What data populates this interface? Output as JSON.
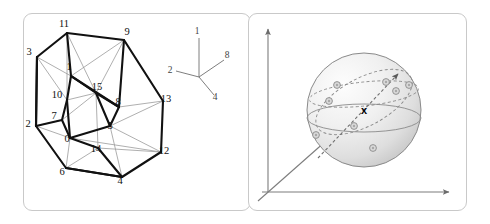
{
  "figure": {
    "background_color": "#ffffff",
    "panel_border_color": "#c9c9c9",
    "panels": [
      {
        "id": "left",
        "name": "tesseract-panel"
      },
      {
        "id": "right",
        "name": "sphere-panel"
      }
    ]
  },
  "left_panel": {
    "name": "tesseract-projection",
    "description": "Projection of a 4-dimensional hypercube (tesseract) showing an outer cube and an inner cube with vertices labelled 0 to 15",
    "edge_color_thick": "#111111",
    "edge_color_thin": "#9a9a9a",
    "vertices": [
      {
        "label": "11",
        "x": 67,
        "y": 33,
        "lx": 64,
        "ly": 27
      },
      {
        "label": "9",
        "x": 124,
        "y": 40,
        "lx": 127,
        "ly": 35
      },
      {
        "label": "3",
        "x": 37,
        "y": 57,
        "lx": 29,
        "ly": 55
      },
      {
        "label": "1",
        "x": 71,
        "y": 76,
        "lx": 69,
        "ly": 70
      },
      {
        "label": "10",
        "x": 67,
        "y": 100,
        "lx": 57,
        "ly": 98
      },
      {
        "label": "15",
        "x": 96,
        "y": 93,
        "lx": 97,
        "ly": 90
      },
      {
        "label": "2",
        "x": 36,
        "y": 126,
        "lx": 28,
        "ly": 127
      },
      {
        "label": "7",
        "x": 62,
        "y": 120,
        "lx": 54,
        "ly": 119
      },
      {
        "label": "8",
        "x": 119,
        "y": 107,
        "lx": 118,
        "ly": 105
      },
      {
        "label": "13",
        "x": 163,
        "y": 101,
        "lx": 166,
        "ly": 102
      },
      {
        "label": "0",
        "x": 70,
        "y": 138,
        "lx": 67,
        "ly": 142
      },
      {
        "label": "5",
        "x": 110,
        "y": 126,
        "lx": 110,
        "ly": 129
      },
      {
        "label": "14",
        "x": 98,
        "y": 148,
        "lx": 96,
        "ly": 152
      },
      {
        "label": "12",
        "x": 161,
        "y": 152,
        "lx": 164,
        "ly": 154
      },
      {
        "label": "6",
        "x": 66,
        "y": 168,
        "lx": 62,
        "ly": 175
      },
      {
        "label": "4",
        "x": 122,
        "y": 177,
        "lx": 120,
        "ly": 184
      }
    ],
    "axis_legend": {
      "name": "basis-axis-legend",
      "origin": {
        "x": 199,
        "y": 77
      },
      "spokes": [
        {
          "label": "1",
          "x": 199,
          "y": 38,
          "lx": 197,
          "ly": 34
        },
        {
          "label": "2",
          "x": 176,
          "y": 71,
          "lx": 170,
          "ly": 73
        },
        {
          "label": "8",
          "x": 224,
          "y": 60,
          "lx": 227,
          "ly": 58
        },
        {
          "label": "4",
          "x": 214,
          "y": 95,
          "lx": 215,
          "ly": 100
        }
      ]
    }
  },
  "right_panel": {
    "name": "sphere-with-axes",
    "description": "Shaded 3D sphere centred on a three-axis coordinate frame, with dashed great circles, a dashed direction arrow, a cross marker at the centre and scattered point markers on the surface",
    "sphere": {
      "cx": 364,
      "cy": 110,
      "r": 57,
      "fill_light": "#fbfbfb",
      "fill_dark": "#d2d2d2",
      "outline_color": "#8a8a8a"
    },
    "axes": [
      {
        "name": "vertical-axis",
        "x1": 268,
        "y1": 192,
        "x2": 268,
        "y2": 29
      },
      {
        "name": "horizontal-axis",
        "x1": 262,
        "y1": 192,
        "x2": 449,
        "y2": 192
      },
      {
        "name": "depth-axis",
        "x1": 258,
        "y1": 201,
        "x2": 352,
        "y2": 118
      }
    ],
    "axis_color": "#7d7d7d",
    "direction_arrow": {
      "name": "direction-arrow",
      "x1": 318,
      "y1": 158,
      "x2": 398,
      "y2": 74,
      "color": "#6f6f6f",
      "style": "dashed"
    },
    "center_marker": {
      "name": "center-cross-marker",
      "glyph": "x",
      "x": 364,
      "y": 110
    },
    "great_circles": [
      {
        "name": "great-circle-upper",
        "style": "dashed"
      },
      {
        "name": "great-circle-tilted",
        "style": "dashed"
      }
    ],
    "equator": {
      "name": "equator-line",
      "style": "solid"
    },
    "points": [
      {
        "name": "surface-point-1",
        "x": 337,
        "y": 85
      },
      {
        "name": "surface-point-2",
        "x": 396,
        "y": 91
      },
      {
        "name": "surface-point-3",
        "x": 409,
        "y": 85
      },
      {
        "name": "surface-point-4",
        "x": 354,
        "y": 126
      },
      {
        "name": "surface-point-5",
        "x": 316,
        "y": 135
      },
      {
        "name": "surface-point-6",
        "x": 373,
        "y": 148
      },
      {
        "name": "surface-point-7",
        "x": 386,
        "y": 82
      },
      {
        "name": "surface-point-8",
        "x": 329,
        "y": 101
      }
    ],
    "point_fill": "#d9d9d9",
    "point_stroke": "#8a8a8a"
  }
}
